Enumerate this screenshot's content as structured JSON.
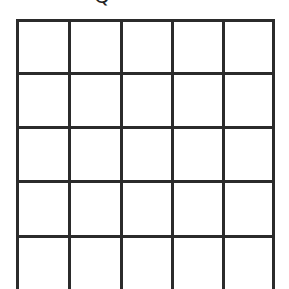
{
  "header": {
    "cropped_glyph": "Q"
  },
  "grid": {
    "columns": 5,
    "rows_visible": 5,
    "line_color": "#2b2b2b",
    "vertical_lines_x": [
      0,
      52,
      104,
      155,
      206,
      257
    ],
    "horizontal_lines_y": [
      0,
      53,
      107,
      161,
      216
    ]
  }
}
